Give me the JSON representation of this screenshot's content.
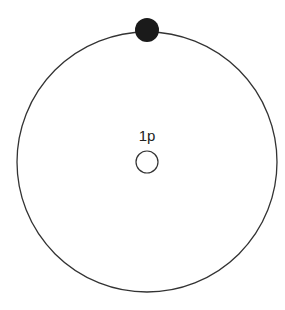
{
  "diagram": {
    "nucleus": {
      "label": "1p",
      "color": "#ffffff",
      "stroke": "#333333"
    },
    "electron": {
      "color": "#1a1a1a"
    },
    "orbit": {
      "stroke": "#333333"
    }
  }
}
